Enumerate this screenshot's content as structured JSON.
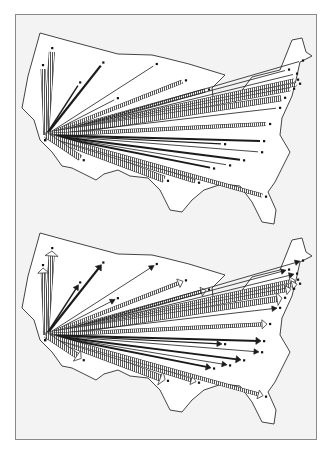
{
  "figure": {
    "panels": [
      {
        "id": "top",
        "label": "Flow lines without arrowheads",
        "origin": [
          46,
          135
        ],
        "arrowheads": false
      },
      {
        "id": "bottom",
        "label": "Flow lines with arrowheads",
        "origin": [
          46,
          335
        ],
        "arrowheads": true
      }
    ]
  },
  "style": {
    "background": "#ffffff",
    "frame_fill": "#f3f3f3",
    "frame_border": "#8a8a8a",
    "map_fill": "#ffffff",
    "map_stroke": "#444444",
    "flow_dark": "#1a1a1a",
    "hatch_fill": "#cfcfcf"
  },
  "flows": [
    {
      "dx": 6,
      "dy": -85,
      "type": "hatch",
      "w": 5
    },
    {
      "dx": -3,
      "dy": -68,
      "type": "hatch",
      "w": 4
    },
    {
      "dx": 56,
      "dy": -71,
      "type": "solid",
      "w": 2.2
    },
    {
      "dx": 33,
      "dy": -51,
      "type": "solid",
      "w": 1.4
    },
    {
      "dx": 109,
      "dy": -70,
      "type": "solid",
      "w": 0.8
    },
    {
      "dx": 70,
      "dy": -36,
      "type": "solid",
      "w": 0.8
    },
    {
      "dx": 138,
      "dy": -54,
      "type": "hatch",
      "w": 3
    },
    {
      "dx": 161,
      "dy": -45,
      "type": "hatch",
      "w": 3
    },
    {
      "dx": 255,
      "dy": -74,
      "type": "solid",
      "w": 0.8
    },
    {
      "dx": 241,
      "dy": -65,
      "type": "solid",
      "w": 0.8
    },
    {
      "dx": 249,
      "dy": -61,
      "type": "solid",
      "w": 0.8
    },
    {
      "dx": 250,
      "dy": -55,
      "type": "hatch",
      "w": 3
    },
    {
      "dx": 252,
      "dy": -51,
      "type": "hatch",
      "w": 3
    },
    {
      "dx": 246,
      "dy": -46,
      "type": "hatch",
      "w": 3
    },
    {
      "dx": 237,
      "dy": -37,
      "type": "hatch",
      "w": 5
    },
    {
      "dx": 232,
      "dy": -27,
      "type": "solid",
      "w": 0.8
    },
    {
      "dx": 222,
      "dy": -11,
      "type": "hatch",
      "w": 3
    },
    {
      "dx": 216,
      "dy": 6,
      "type": "solid",
      "w": 2
    },
    {
      "dx": 214,
      "dy": 17,
      "type": "solid",
      "w": 0.8
    },
    {
      "dx": 177,
      "dy": 9,
      "type": "solid",
      "w": 1.2
    },
    {
      "dx": 196,
      "dy": 25,
      "type": "solid",
      "w": 2
    },
    {
      "dx": 182,
      "dy": 30,
      "type": "solid",
      "w": 0.8
    },
    {
      "dx": 166,
      "dy": 33,
      "type": "solid",
      "w": 1.8
    },
    {
      "dx": 120,
      "dy": 45,
      "type": "hatch",
      "w": 6
    },
    {
      "dx": 151,
      "dy": 47,
      "type": "hatch",
      "w": 3
    },
    {
      "dx": 218,
      "dy": 61,
      "type": "hatch",
      "w": 3
    },
    {
      "dx": 36,
      "dy": 24,
      "type": "hatch",
      "w": 5
    }
  ]
}
